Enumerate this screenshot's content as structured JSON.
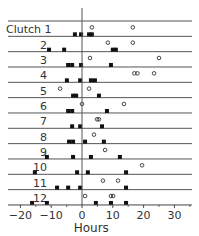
{
  "chart_data": {
    "type": "scatter",
    "title": "",
    "xlabel": "Hours",
    "ylabel": "",
    "xlim": [
      -22,
      36
    ],
    "xticks": [
      -20,
      -10,
      0,
      10,
      20,
      30
    ],
    "grid": false,
    "legend": null,
    "row_prefix": "Clutch",
    "series_styles": {
      "filled": {
        "marker": "square",
        "fill": "#111111"
      },
      "open": {
        "marker": "circle",
        "fill": "none"
      }
    },
    "rows": [
      {
        "label": "Clutch 1",
        "filled": [
          -2.3,
          -0.3,
          2.3,
          3.2
        ],
        "open": [
          3.2,
          16.5
        ]
      },
      {
        "label": "2",
        "filled": [
          -10.7,
          -5.8,
          10.0,
          11.0
        ],
        "open": [
          8.4,
          16.5
        ]
      },
      {
        "label": "3",
        "filled": [
          -4.5,
          -3.2,
          -0.3,
          9.4
        ],
        "open": [
          2.6,
          25.0
        ]
      },
      {
        "label": "4",
        "filled": [
          -4.9,
          -0.6,
          2.9,
          4.2
        ],
        "open": [
          17.0,
          18.0,
          23.4
        ]
      },
      {
        "label": "5",
        "filled": [
          -2.9,
          -1.9,
          5.5
        ],
        "open": [
          -7.1,
          2.3
        ]
      },
      {
        "label": "6",
        "filled": [
          -4.5,
          -3.2,
          8.1
        ],
        "open": [
          0.0,
          13.6
        ]
      },
      {
        "label": "7",
        "filled": [
          -3.2,
          -0.6,
          6.5
        ],
        "open": [
          4.9,
          5.5
        ]
      },
      {
        "label": "8",
        "filled": [
          -4.2,
          -2.9,
          1.0,
          7.1
        ],
        "open": [
          3.9
        ]
      },
      {
        "label": "9",
        "filled": [
          -11.4,
          -2.9,
          2.9,
          12.3
        ],
        "open": [
          7.5
        ]
      },
      {
        "label": "10",
        "filled": [
          -15.3,
          -1.6,
          1.9,
          14.3
        ],
        "open": [
          19.5
        ]
      },
      {
        "label": "11",
        "filled": [
          -8.1,
          -4.5,
          -0.6,
          14.3
        ],
        "open": [
          6.8,
          11.7
        ]
      },
      {
        "label": "12",
        "filled": [
          -16.2,
          -11.4,
          4.5,
          9.4,
          14.3
        ],
        "open": [
          1.0,
          9.4,
          10.1
        ]
      }
    ]
  }
}
